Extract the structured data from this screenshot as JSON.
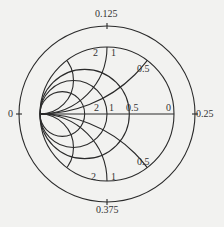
{
  "diagram": {
    "type": "smith-chart",
    "orientation": "admittance (short-circuit point on left)",
    "line_color": "#2a2a2a",
    "background": "#f2f2f0",
    "wavelength_scale": {
      "left": "0",
      "top": "0.125",
      "right": "0.25",
      "bottom": "0.375"
    },
    "conductance_circles": [
      {
        "value": 2,
        "label": "2"
      },
      {
        "value": 1,
        "label": "1"
      },
      {
        "value": 0.5,
        "label": "0.5"
      }
    ],
    "axis_end_label": "0",
    "susceptance_arcs_top": [
      {
        "value": 2,
        "label": "2"
      },
      {
        "value": 1,
        "label": "1"
      },
      {
        "value": 0.5,
        "label": "0.5"
      }
    ],
    "susceptance_arcs_bottom": [
      {
        "value": 2,
        "label": "2"
      },
      {
        "value": 1,
        "label": "1"
      },
      {
        "value": 0.5,
        "label": "0.5"
      }
    ]
  }
}
